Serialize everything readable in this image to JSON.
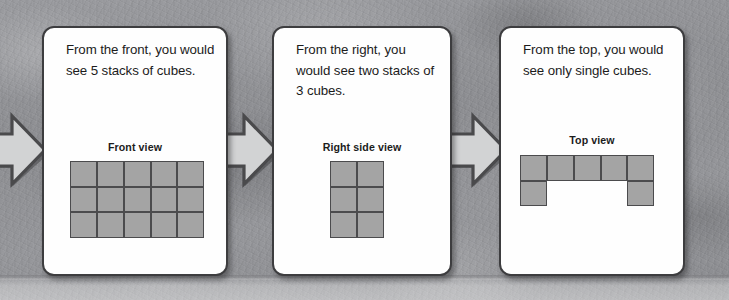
{
  "background": {
    "description": "mottled gray concrete texture",
    "base_color": "#93949a",
    "bottom_band_color": "#d2d3d5"
  },
  "colors": {
    "panel_fill": "#fefefe",
    "panel_border": "#3d3d3f",
    "cube_fill": "#a4a4a4",
    "cube_border": "#4b4b4d",
    "arrow_fill": "#d2d3d4",
    "arrow_border": "#4a4a4c",
    "text": "#1c1c1c"
  },
  "arrows": [
    {
      "name": "arrow-to-front-view",
      "direction": "right"
    },
    {
      "name": "arrow-to-right-side-view",
      "direction": "right"
    },
    {
      "name": "arrow-to-top-view",
      "direction": "right"
    }
  ],
  "panels": [
    {
      "id": "front",
      "text": "From the front, you would see 5 stacks of cubes.",
      "view_label": "Front view",
      "figure": {
        "type": "cube-grid",
        "rows": 3,
        "cols": 5,
        "filled": [
          [
            1,
            1,
            1,
            1,
            1
          ],
          [
            1,
            1,
            1,
            1,
            1
          ],
          [
            1,
            1,
            1,
            1,
            1
          ]
        ],
        "cube_count": 15
      }
    },
    {
      "id": "right",
      "text": "From the right, you would see two stacks of 3 cubes.",
      "view_label": "Right side view",
      "figure": {
        "type": "cube-grid",
        "rows": 3,
        "cols": 2,
        "filled": [
          [
            1,
            1
          ],
          [
            1,
            1
          ],
          [
            1,
            1
          ]
        ],
        "cube_count": 6
      }
    },
    {
      "id": "top",
      "text": "From the top, you would see only single cubes.",
      "view_label": "Top view",
      "figure": {
        "type": "cube-grid",
        "rows": 2,
        "cols": 5,
        "filled": [
          [
            1,
            1,
            1,
            1,
            1
          ],
          [
            1,
            0,
            0,
            0,
            1
          ]
        ],
        "cube_count": 7
      }
    }
  ]
}
